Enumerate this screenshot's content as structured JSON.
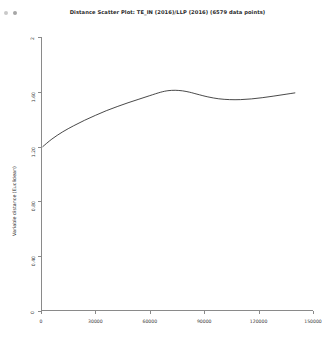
{
  "window": {
    "title": "Distance Scatter Plot: TE_IN (2016)/LLP (2016) (6579 data points)",
    "controls": [
      "window-dot-1",
      "window-dot-2"
    ]
  },
  "chart_data": {
    "type": "line",
    "title": "Distance Scatter Plot: TE_IN (2016)/LLP (2016) (6579 data points)",
    "xlabel": "Geographical distance; threshold=150000",
    "ylabel": "Variable distance (Euclidean)",
    "xlim": [
      0,
      150000
    ],
    "ylim": [
      0,
      2
    ],
    "grid": false,
    "legend": null,
    "n_points": 6579,
    "xticks": [
      0,
      30000,
      60000,
      90000,
      120000,
      150000
    ],
    "xtick_labels": [
      "0",
      "30000",
      "60000",
      "90000",
      "120000",
      "150000"
    ],
    "yticks": [
      0,
      0.4,
      0.8,
      1.2,
      1.6,
      2
    ],
    "ytick_labels": [
      "0",
      "0.40",
      "0.80",
      "1.20",
      "1.60",
      "2"
    ],
    "series": [
      {
        "name": "variogram",
        "x": [
          1000,
          6000,
          12000,
          18000,
          24000,
          30000,
          36000,
          42000,
          48000,
          54000,
          60000,
          66000,
          70000,
          74000,
          78000,
          82000,
          86000,
          92000,
          98000,
          104000,
          110000,
          116000,
          122000,
          128000,
          134000,
          140000
        ],
        "y": [
          1.2,
          1.255,
          1.308,
          1.352,
          1.392,
          1.428,
          1.462,
          1.492,
          1.52,
          1.546,
          1.572,
          1.597,
          1.608,
          1.611,
          1.607,
          1.597,
          1.583,
          1.563,
          1.549,
          1.543,
          1.543,
          1.548,
          1.557,
          1.568,
          1.58,
          1.592
        ]
      }
    ]
  }
}
